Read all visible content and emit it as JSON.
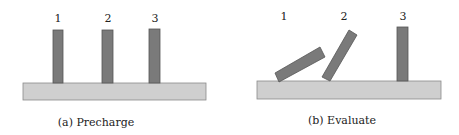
{
  "panels": [
    {
      "caption": "(a) Precharge",
      "labels": [
        "1",
        "2",
        "3"
      ]
    },
    {
      "caption": "(b) Evaluate",
      "labels": [
        "1",
        "2",
        "3"
      ]
    }
  ],
  "colors": {
    "bar_fill": "#7a7a7a",
    "bar_stroke": "#555555",
    "base_fill": "#cfcfcf",
    "base_stroke": "#8a8a8a"
  }
}
